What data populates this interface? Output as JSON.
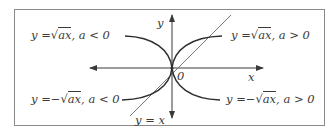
{
  "figure": {
    "type": "function-graph-sketch",
    "axes": {
      "x_label": "x",
      "y_label": "y",
      "origin_label": "0"
    },
    "reference_line": {
      "label": "y = x"
    },
    "curves": [
      {
        "id": "upper-left",
        "lhs": "y =",
        "sign": "",
        "radicand": "ax",
        "condition": ", a < 0",
        "quadrant": "II"
      },
      {
        "id": "upper-right",
        "lhs": "y =",
        "sign": "",
        "radicand": "ax",
        "condition": ", a > 0",
        "quadrant": "I"
      },
      {
        "id": "lower-left",
        "lhs": "y =",
        "sign": "−",
        "radicand": "ax",
        "condition": ", a < 0",
        "quadrant": "III"
      },
      {
        "id": "lower-right",
        "lhs": "y =",
        "sign": "−",
        "radicand": "ax",
        "condition": ", a > 0",
        "quadrant": "IV"
      }
    ],
    "colors": {
      "curve": "#2e2e2e",
      "axis": "#3a3a3a",
      "reference_line": "#6a6a6a",
      "frame": "#8a8a8a",
      "text": "#3a3a3a"
    }
  }
}
